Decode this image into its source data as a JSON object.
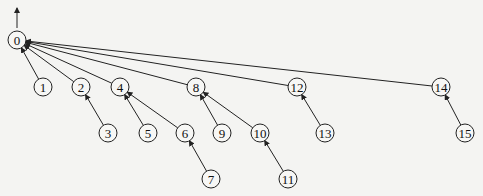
{
  "diagram": {
    "type": "tree",
    "root": "0",
    "nodes": [
      {
        "id": "0",
        "label": "0",
        "x": 17,
        "y": 40
      },
      {
        "id": "1",
        "label": "1",
        "x": 43,
        "y": 87
      },
      {
        "id": "2",
        "label": "2",
        "x": 81,
        "y": 87
      },
      {
        "id": "4",
        "label": "4",
        "x": 120,
        "y": 87
      },
      {
        "id": "8",
        "label": "8",
        "x": 196,
        "y": 87
      },
      {
        "id": "12",
        "label": "12",
        "x": 297,
        "y": 87
      },
      {
        "id": "14",
        "label": "14",
        "x": 441,
        "y": 87
      },
      {
        "id": "3",
        "label": "3",
        "x": 108,
        "y": 133
      },
      {
        "id": "5",
        "label": "5",
        "x": 148,
        "y": 133
      },
      {
        "id": "6",
        "label": "6",
        "x": 185,
        "y": 133
      },
      {
        "id": "9",
        "label": "9",
        "x": 222,
        "y": 133
      },
      {
        "id": "10",
        "label": "10",
        "x": 260,
        "y": 133
      },
      {
        "id": "13",
        "label": "13",
        "x": 325,
        "y": 133
      },
      {
        "id": "15",
        "label": "15",
        "x": 465,
        "y": 133
      },
      {
        "id": "7",
        "label": "7",
        "x": 211,
        "y": 179
      },
      {
        "id": "11",
        "label": "11",
        "x": 288,
        "y": 179
      }
    ],
    "edges": [
      {
        "from": "1",
        "to": "0"
      },
      {
        "from": "2",
        "to": "0"
      },
      {
        "from": "4",
        "to": "0"
      },
      {
        "from": "8",
        "to": "0"
      },
      {
        "from": "12",
        "to": "0"
      },
      {
        "from": "14",
        "to": "0"
      },
      {
        "from": "3",
        "to": "2"
      },
      {
        "from": "5",
        "to": "4"
      },
      {
        "from": "6",
        "to": "4"
      },
      {
        "from": "7",
        "to": "6"
      },
      {
        "from": "9",
        "to": "8"
      },
      {
        "from": "10",
        "to": "8"
      },
      {
        "from": "11",
        "to": "10"
      },
      {
        "from": "13",
        "to": "12"
      },
      {
        "from": "15",
        "to": "14"
      }
    ],
    "root_arrow": {
      "x": 17,
      "y1": 28,
      "y2": 8
    }
  }
}
